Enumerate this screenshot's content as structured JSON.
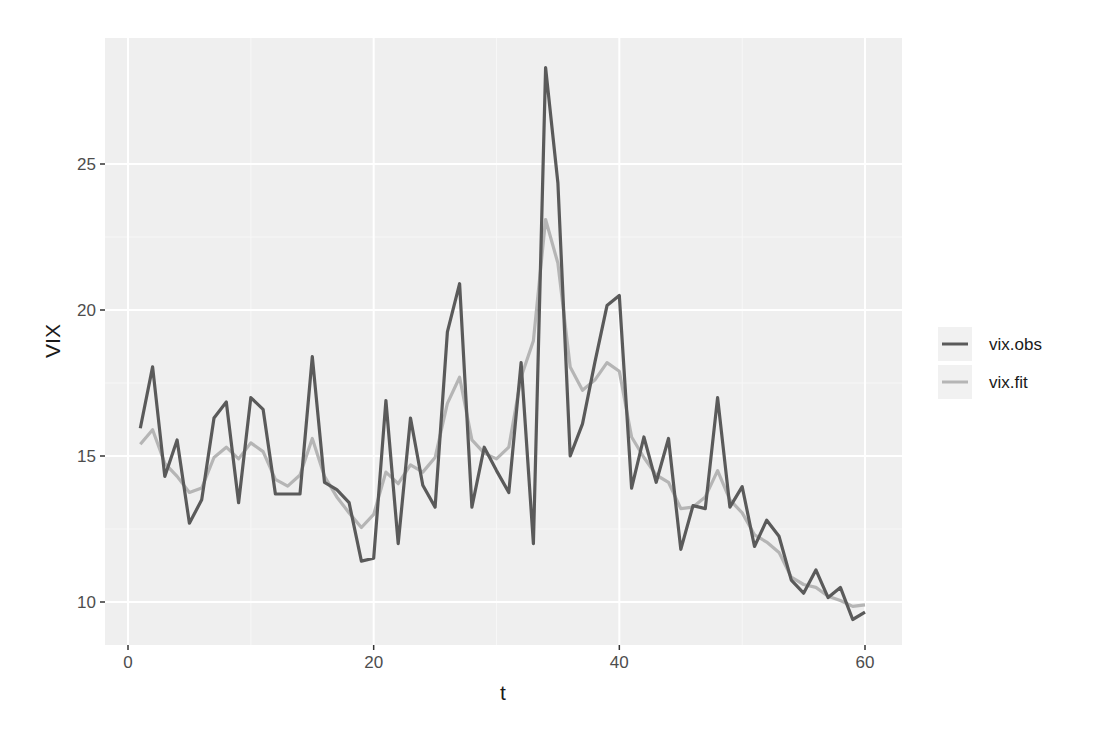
{
  "chart_data": {
    "type": "line",
    "title": "",
    "xlabel": "t",
    "ylabel": "VIX",
    "xlim": [
      -2,
      63
    ],
    "ylim": [
      8.5,
      29.3
    ],
    "x_ticks": [
      0,
      20,
      40,
      60
    ],
    "y_ticks": [
      10,
      15,
      20,
      25
    ],
    "grid": true,
    "legend_position": "right",
    "legend_title": "",
    "x": [
      1,
      2,
      3,
      4,
      5,
      6,
      7,
      8,
      9,
      10,
      11,
      12,
      13,
      14,
      15,
      16,
      17,
      18,
      19,
      20,
      21,
      22,
      23,
      24,
      25,
      26,
      27,
      28,
      29,
      30,
      31,
      32,
      33,
      34,
      35,
      36,
      37,
      38,
      39,
      40,
      41,
      42,
      43,
      44,
      45,
      46,
      47,
      48,
      49,
      50,
      51,
      52,
      53,
      54,
      55,
      56,
      57,
      58,
      59,
      60
    ],
    "series": [
      {
        "name": "vix.obs",
        "color": "#5a5a5a",
        "values": [
          15.95,
          18.05,
          14.3,
          15.55,
          12.7,
          13.5,
          16.3,
          16.85,
          13.4,
          17.0,
          16.6,
          13.7,
          13.7,
          13.7,
          18.4,
          14.1,
          13.85,
          13.4,
          11.4,
          11.5,
          16.9,
          12.0,
          16.3,
          14.0,
          13.25,
          19.25,
          20.9,
          13.25,
          15.3,
          14.5,
          13.75,
          18.2,
          12.0,
          28.3,
          24.35,
          15.0,
          16.1,
          18.2,
          20.15,
          20.5,
          13.9,
          15.65,
          14.1,
          15.6,
          11.8,
          13.3,
          13.2,
          17.0,
          13.25,
          13.95,
          11.9,
          12.8,
          12.25,
          10.75,
          10.3,
          11.1,
          10.15,
          10.5,
          9.4,
          9.65
        ]
      },
      {
        "name": "vix.fit",
        "color": "#b5b5b5",
        "values": [
          15.4,
          15.9,
          14.75,
          14.3,
          13.75,
          13.9,
          14.95,
          15.3,
          14.9,
          15.45,
          15.15,
          14.2,
          13.97,
          14.35,
          15.6,
          14.3,
          13.6,
          13.05,
          12.55,
          13.0,
          14.45,
          14.05,
          14.7,
          14.45,
          14.95,
          16.8,
          17.7,
          15.55,
          15.1,
          14.9,
          15.3,
          17.7,
          18.95,
          23.1,
          21.6,
          18.05,
          17.25,
          17.6,
          18.2,
          17.9,
          15.65,
          14.95,
          14.35,
          14.1,
          13.2,
          13.25,
          13.6,
          14.5,
          13.5,
          13.05,
          12.3,
          12.05,
          11.7,
          10.85,
          10.6,
          10.5,
          10.2,
          10.05,
          9.85,
          9.9
        ]
      }
    ]
  },
  "axes": {
    "x_title": "t",
    "y_title": "VIX",
    "x_tick_labels": [
      "0",
      "20",
      "40",
      "60"
    ],
    "y_tick_labels": [
      "10",
      "15",
      "20",
      "25"
    ]
  },
  "legend": {
    "items": [
      {
        "label": "vix.obs",
        "color": "#5a5a5a"
      },
      {
        "label": "vix.fit",
        "color": "#b5b5b5"
      }
    ]
  },
  "style": {
    "panel_bg": "#efefef",
    "grid_major": "#ffffff",
    "grid_minor": "#f7f7f7",
    "legend_key_bg": "#f1f1f1"
  }
}
